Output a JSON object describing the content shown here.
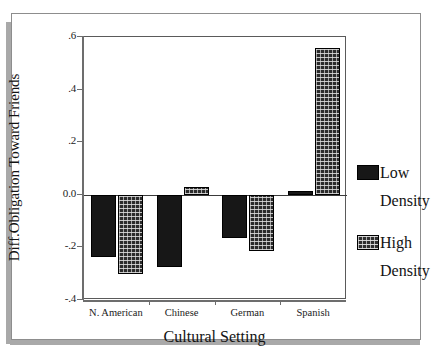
{
  "chart_data": {
    "type": "bar",
    "title": "",
    "xlabel": "Cultural Setting",
    "ylabel": "Diff.Obligation Toward Friends",
    "categories": [
      "N. American",
      "Chinese",
      "German",
      "Spanish"
    ],
    "series": [
      {
        "name": "Low Density",
        "values": [
          -0.235,
          -0.275,
          -0.165,
          0.015
        ]
      },
      {
        "name": "High Density",
        "values": [
          -0.3,
          0.03,
          -0.215,
          0.56
        ]
      }
    ],
    "ylim": [
      -0.4,
      0.6
    ],
    "ytick_values": [
      0.6,
      0.4,
      0.2,
      0.0,
      -0.2,
      -0.4
    ],
    "ytick_labels": [
      ".6",
      ".4",
      ".2",
      "0.0",
      "-.2",
      "-.4"
    ],
    "grid": false,
    "legend_position": "right",
    "zero_line": true
  },
  "axes": {
    "y_title": "Diff.Obligation Toward Friends",
    "x_title": "Cultural Setting",
    "y_ticks": [
      {
        "label": ".6",
        "value": 0.6
      },
      {
        "label": ".4",
        "value": 0.4
      },
      {
        "label": ".2",
        "value": 0.2
      },
      {
        "label": "0.0",
        "value": 0.0
      },
      {
        "label": "-.2",
        "value": -0.2
      },
      {
        "label": "-.4",
        "value": -0.4
      }
    ],
    "x_ticks": [
      {
        "label": "N. American"
      },
      {
        "label": "Chinese"
      },
      {
        "label": "German"
      },
      {
        "label": "Spanish"
      }
    ]
  },
  "legend": {
    "entries": [
      {
        "name": "low-density",
        "line1": "Low",
        "line2": "Density",
        "color": "#171717",
        "fill": "solid"
      },
      {
        "name": "high-density",
        "line1": "High",
        "line2": "Density",
        "color": "#2f2f2f",
        "fill": "textured"
      }
    ]
  },
  "colors": {
    "low_density": "#171717",
    "high_density": "#2f2f2f",
    "axis": "#6d6d6d",
    "frame": "#8d8d8d",
    "shadow": "#a9a9a9",
    "background": "#ffffff"
  }
}
